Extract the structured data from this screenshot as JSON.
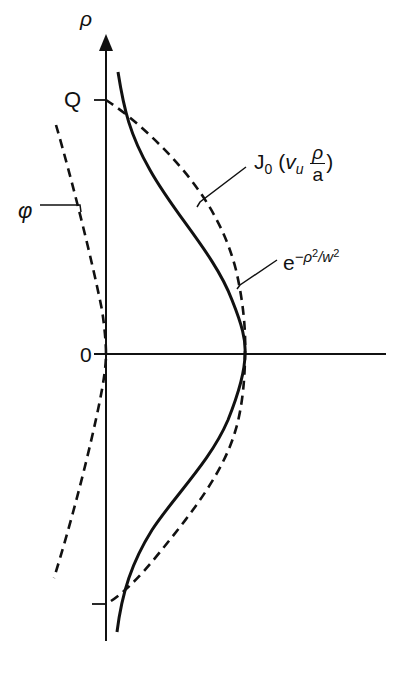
{
  "diagram": {
    "axes": {
      "vertical_label": "ρ",
      "vertical_tick_top": "Q",
      "origin_label": "0",
      "vertical_tick_bottom": ""
    },
    "curves": [
      {
        "name": "bessel",
        "style": "dashed",
        "label_main": "J",
        "label_sub": "0",
        "label_arg_open": "(",
        "label_arg_var": "v",
        "label_arg_sub": "u",
        "label_frac_num": "ρ",
        "label_frac_den": "a",
        "label_arg_close": ")"
      },
      {
        "name": "gaussian",
        "style": "solid",
        "label_base": "e",
        "label_exp_prefix": "−ρ",
        "label_exp_pow1": "2",
        "label_exp_mid": "/w",
        "label_exp_pow2": "2"
      },
      {
        "name": "phase",
        "style": "dashed",
        "label": "φ"
      }
    ],
    "colors": {
      "ink": "#111111",
      "background": "#ffffff"
    }
  }
}
